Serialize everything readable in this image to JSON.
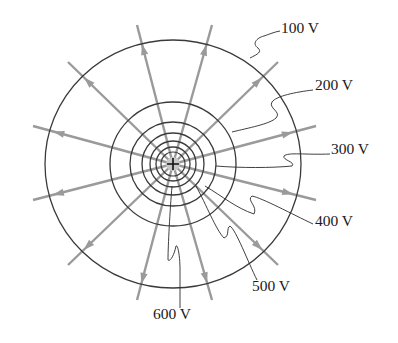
{
  "figure": {
    "charge": {
      "symbol": "+",
      "x": 173,
      "y": 164
    },
    "colors": {
      "equipotential": "#3a3a3a",
      "field_line": "#9a9a9a",
      "label_text": "#1a1a1a",
      "leader": "#2a2a2a",
      "background": "#ffffff"
    },
    "equipotentials": [
      {
        "potential": "100 V",
        "rx": 128,
        "ry": 124
      },
      {
        "potential": "200 V",
        "rx": 63,
        "ry": 62
      },
      {
        "potential": "300 V",
        "rx": 43,
        "ry": 42
      },
      {
        "potential": "400 V",
        "rx": 31,
        "ry": 31
      },
      {
        "potential": "500 V",
        "rx": 23,
        "ry": 23
      },
      {
        "potential": "600 V",
        "rx": 17,
        "ry": 17
      }
    ],
    "field_line_ends": [
      [
        137,
        25
      ],
      [
        212,
        25
      ],
      [
        68,
        62
      ],
      [
        278,
        62
      ],
      [
        33,
        126
      ],
      [
        316,
        126
      ],
      [
        33,
        200
      ],
      [
        316,
        200
      ],
      [
        68,
        265
      ],
      [
        278,
        265
      ],
      [
        137,
        300
      ],
      [
        212,
        300
      ]
    ],
    "labels": [
      {
        "text": "100 V",
        "x": 281,
        "y": 28
      },
      {
        "text": "200 V",
        "x": 315,
        "y": 85
      },
      {
        "text": "300 V",
        "x": 331,
        "y": 149
      },
      {
        "text": "400 V",
        "x": 315,
        "y": 221
      },
      {
        "text": "500 V",
        "x": 252,
        "y": 286
      },
      {
        "text": "600 V",
        "x": 153,
        "y": 314
      }
    ]
  }
}
